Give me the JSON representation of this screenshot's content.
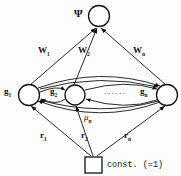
{
  "diagram": {
    "colors": {
      "stroke": "#111111",
      "node_fill": "#ffffff",
      "background": "#fdfdfd"
    },
    "nodes": {
      "output": {
        "label": "Ψ",
        "shape": "circle"
      },
      "hidden_first": {
        "label": "g",
        "subscript": "1",
        "shape": "circle"
      },
      "hidden_second": {
        "label": "g",
        "subscript": "2",
        "shape": "circle"
      },
      "hidden_last": {
        "label": "g",
        "subscript": "n",
        "shape": "circle"
      },
      "bias": {
        "label": "const. (=1)",
        "shape": "square"
      }
    },
    "edge_labels": {
      "w1": {
        "base": "W",
        "sub": "1"
      },
      "w2": {
        "base": "W",
        "sub": "2"
      },
      "wn": {
        "base": "W",
        "sub": "n"
      },
      "r1": {
        "base": "r",
        "sub": "1"
      },
      "r2": {
        "base": "r",
        "sub": "2"
      },
      "rn": {
        "base": "r",
        "sub": "n"
      },
      "mu": {
        "base": "μ",
        "sub": "n"
      }
    },
    "ellipsis": "······"
  }
}
